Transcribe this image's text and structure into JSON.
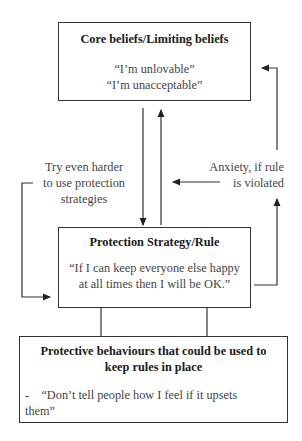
{
  "diagram": {
    "core_box": {
      "title": "Core beliefs/Limiting beliefs",
      "lines": [
        "“I’m unlovable”",
        "“I’m unacceptable”"
      ]
    },
    "strategy_box": {
      "title": "Protection Strategy/Rule",
      "lines": [
        "“If I can keep everyone else happy",
        "at all times then I will be OK.”"
      ]
    },
    "behaviours_box": {
      "title_lines": [
        "Protective behaviours that could be used to",
        "keep rules in place"
      ],
      "items": [
        "-    “Don’t tell people how I feel if it upsets",
        "them”"
      ]
    },
    "left_label": {
      "lines": [
        "Try even harder",
        "to use protection",
        "strategies"
      ]
    },
    "right_label": {
      "lines": [
        "Anxiety, if rule",
        "is violated"
      ]
    },
    "colors": {
      "line": "#333333",
      "text": "#444444",
      "title": "#1a1a1a"
    }
  }
}
